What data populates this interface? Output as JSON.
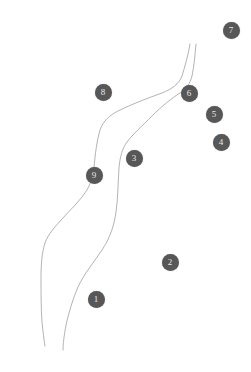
{
  "map": {
    "width": 251,
    "height": 372,
    "background_color": "#ffffff",
    "marker_fill_color": "#575757",
    "marker_text_color": "#e8e8e8",
    "route_color": "#aaaaaa",
    "route_width": 0.9
  },
  "markers": [
    {
      "label": "7",
      "x": 231,
      "y": 30
    },
    {
      "label": "6",
      "x": 189,
      "y": 93
    },
    {
      "label": "8",
      "x": 103,
      "y": 92
    },
    {
      "label": "5",
      "x": 214,
      "y": 114
    },
    {
      "label": "4",
      "x": 221,
      "y": 142
    },
    {
      "label": "3",
      "x": 134,
      "y": 158
    },
    {
      "label": "9",
      "x": 94,
      "y": 175
    },
    {
      "label": "2",
      "x": 170,
      "y": 262
    },
    {
      "label": "1",
      "x": 96,
      "y": 299
    }
  ],
  "routes": [
    {
      "name": "west-route",
      "path": "M 190 44 C 188 56, 185 66, 182 76 C 179 84, 172 89, 162 93 C 148 98, 132 104, 118 111 C 110 115, 103 121, 100 130 C 97 140, 95 155, 94 168 C 93 176, 91 183, 87 190 C 80 201, 70 210, 62 219 C 55 227, 48 234, 45 243 C 42 252, 41 264, 41 278 C 41 292, 41 308, 42 322 C 43 332, 44 340, 45 346"
    },
    {
      "name": "east-route",
      "path": "M 196 44 C 195 56, 194 66, 192 76 C 190 84, 186 89, 180 93 C 172 98, 162 106, 152 116 C 142 126, 133 134, 127 142 C 122 149, 120 157, 119 168 C 118 182, 118 198, 116 212 C 114 226, 110 238, 102 250 C 94 262, 84 274, 78 287 C 73 298, 69 312, 66 325 C 64 336, 63 344, 63 350"
    }
  ]
}
